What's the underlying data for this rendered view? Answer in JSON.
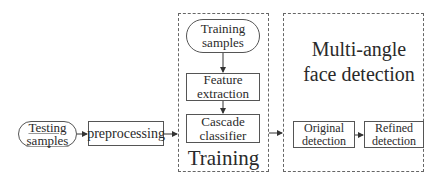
{
  "diagram": {
    "nodes": {
      "testing_samples": {
        "label": "Testing samples",
        "shape": "rounded"
      },
      "preprocessing": {
        "label": "preprocessing",
        "shape": "rect"
      },
      "training_samples": {
        "label": "Training samples",
        "shape": "rounded"
      },
      "feature_extraction": {
        "label": "Feature extraction",
        "shape": "rect"
      },
      "cascade_classifier": {
        "label": "Cascade classifier",
        "shape": "rect"
      },
      "original_detection": {
        "label": "Original detection",
        "shape": "rect"
      },
      "refined_detection": {
        "label": "Refined detection",
        "shape": "rect"
      }
    },
    "groups": {
      "training": {
        "label": "Training",
        "style": "dashed"
      },
      "detection": {
        "label": "Multi-angle face detection",
        "style": "dashed"
      }
    },
    "edges": [
      {
        "from": "testing_samples",
        "to": "preprocessing"
      },
      {
        "from": "preprocessing",
        "to": "training"
      },
      {
        "from": "training_samples",
        "to": "feature_extraction"
      },
      {
        "from": "feature_extraction",
        "to": "cascade_classifier"
      },
      {
        "from": "training",
        "to": "detection"
      },
      {
        "from": "original_detection",
        "to": "refined_detection"
      }
    ],
    "colors": {
      "stroke": "#555555",
      "text": "#2a2a2a",
      "background": "#ffffff"
    }
  }
}
